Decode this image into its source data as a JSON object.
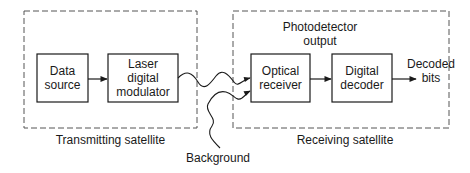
{
  "diagram": {
    "transmitting": {
      "label": "Transmitting satellite",
      "blocks": [
        {
          "id": "data-source",
          "line1": "Data",
          "line2": "source"
        },
        {
          "id": "laser-modulator",
          "line1": "Laser",
          "line2": "digital",
          "line3": "modulator"
        }
      ]
    },
    "receiving": {
      "label": "Receiving satellite",
      "annotation_line1": "Photodetector",
      "annotation_line2": "output",
      "blocks": [
        {
          "id": "optical-receiver",
          "line1": "Optical",
          "line2": "receiver"
        },
        {
          "id": "digital-decoder",
          "line1": "Digital",
          "line2": "decoder"
        }
      ],
      "output_line1": "Decoded",
      "output_line2": "bits"
    },
    "noise_label": "Background",
    "colors": {
      "stroke": "#1a1a1a",
      "background": "#ffffff"
    }
  }
}
